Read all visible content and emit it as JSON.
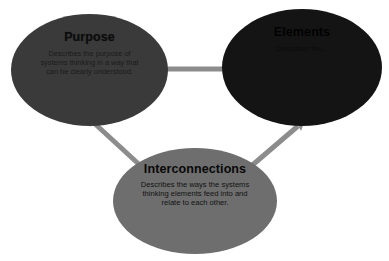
{
  "diagram": {
    "type": "triangular-relationship-diagram",
    "background_color": "#ffffff",
    "connector_color": "#8c8c8c",
    "nodes": [
      {
        "id": "purpose",
        "title": "Purpose",
        "body": "Describes the purpose of systems thinking in a way that can be clearly understood.",
        "fill_color": "#3a3a3a",
        "text_color": "#111111",
        "position": "top-left"
      },
      {
        "id": "elements",
        "title": "Elements",
        "body": "Describes the...",
        "fill_color": "#141414",
        "text_color": "#0a0a0a",
        "position": "top-right"
      },
      {
        "id": "interconnections",
        "title": "Interconnections",
        "body": "Describes the ways the systems thinking elements feed into and relate to each other.",
        "fill_color": "#6e6e6e",
        "text_color": "#101010",
        "position": "bottom-center"
      }
    ],
    "connectors": [
      {
        "id": "purpose-elements",
        "from": "purpose",
        "to": "elements",
        "style": "double-arrow"
      },
      {
        "id": "purpose-interconnections",
        "from": "purpose",
        "to": "interconnections",
        "style": "double-arrow"
      },
      {
        "id": "elements-interconnections",
        "from": "elements",
        "to": "interconnections",
        "style": "double-arrow"
      }
    ]
  }
}
